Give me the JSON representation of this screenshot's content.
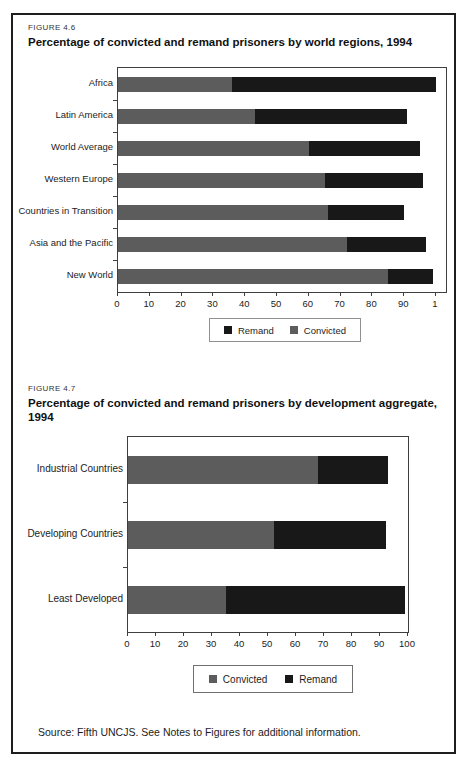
{
  "page": {
    "source_note": "Source: Fifth UNCJS. See Notes to Figures for additional information."
  },
  "colors": {
    "convicted": "#5c5c5c",
    "remand": "#181818",
    "frame_border": "#1e1e1e",
    "plot_border": "#3f3f3f"
  },
  "chart_data": [
    {
      "type": "bar",
      "orientation": "horizontal",
      "stacked": true,
      "figure_label": "FIGURE 4.6",
      "title": "Percentage of convicted and remand prisoners by world regions, 1994",
      "title_lines": [
        "Percentage of convicted and remand prisoners by world regions, 1994"
      ],
      "categories": [
        "Africa",
        "Latin America",
        "World Average",
        "Western Europe",
        "Countries in Transition",
        "Asia and the Pacific",
        "New World"
      ],
      "series": [
        {
          "name": "Convicted",
          "color": "#5c5c5c",
          "values": [
            36,
            43,
            60,
            65,
            66,
            72,
            85
          ]
        },
        {
          "name": "Remand",
          "color": "#181818",
          "values": [
            64,
            48,
            35,
            31,
            24,
            25,
            14
          ]
        }
      ],
      "xlim": [
        0,
        100
      ],
      "grid": false,
      "x_tick_labels": [
        "0",
        "10",
        "20",
        "30",
        "40",
        "50",
        "60",
        "70",
        "80",
        "90",
        "1"
      ],
      "legend_position": "bottom-center",
      "legend": [
        {
          "label": "Remand",
          "color": "#181818"
        },
        {
          "label": "Convicted",
          "color": "#5c5c5c"
        }
      ]
    },
    {
      "type": "bar",
      "orientation": "horizontal",
      "stacked": true,
      "figure_label": "FIGURE 4.7",
      "title": "Percentage of convicted and remand prisoners by development aggregate, 1994",
      "title_lines": [
        "Percentage of convicted and remand prisoners by development aggregate,",
        "1994"
      ],
      "categories": [
        "Industrial Countries",
        "Developing Countries",
        "Least Developed"
      ],
      "series": [
        {
          "name": "Convicted",
          "color": "#5c5c5c",
          "values": [
            68,
            52,
            35
          ]
        },
        {
          "name": "Remand",
          "color": "#181818",
          "values": [
            25,
            40,
            64
          ]
        }
      ],
      "xlim": [
        0,
        100
      ],
      "grid": false,
      "x_tick_labels": [
        "0",
        "10",
        "20",
        "30",
        "40",
        "50",
        "60",
        "70",
        "80",
        "90",
        "100"
      ],
      "legend_position": "bottom-center",
      "legend": [
        {
          "label": "Convicted",
          "color": "#5c5c5c"
        },
        {
          "label": "Remand",
          "color": "#181818"
        }
      ]
    }
  ]
}
